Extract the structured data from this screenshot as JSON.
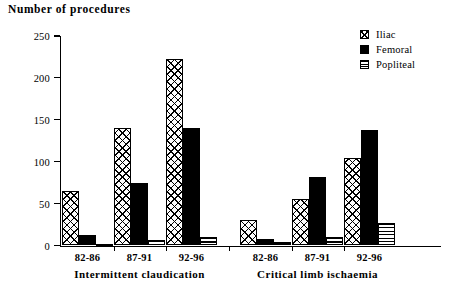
{
  "chart_data": {
    "type": "bar",
    "title": "Number of procedures",
    "xlabel": "",
    "ylabel": "Number of procedures",
    "ylim": [
      0,
      250
    ],
    "yticks": [
      0,
      50,
      100,
      150,
      200,
      250
    ],
    "grid": false,
    "legend_position": "top-right",
    "categories": [
      "82-86",
      "87-91",
      "92-96",
      "82-86",
      "87-91",
      "92-96"
    ],
    "group_labels": [
      "Intermittent claudication",
      "Critical limb ischaemia"
    ],
    "groups": [
      {
        "name": "Intermittent claudication",
        "periods": [
          "82-86",
          "87-91",
          "92-96"
        ]
      },
      {
        "name": "Critical limb ischaemia",
        "periods": [
          "82-86",
          "87-91",
          "92-96"
        ]
      }
    ],
    "series": [
      {
        "name": "Iliac",
        "pattern": "cross-hatch",
        "values": [
          65,
          140,
          222,
          30,
          55,
          105
        ]
      },
      {
        "name": "Femoral",
        "pattern": "solid-black",
        "values": [
          13,
          75,
          140,
          8,
          82,
          138
        ]
      },
      {
        "name": "Popliteal",
        "pattern": "horizontal-stripe",
        "values": [
          2,
          7,
          10,
          4,
          10,
          27
        ]
      }
    ]
  },
  "axis": {
    "y_tick_labels": [
      "0",
      "50",
      "100",
      "150",
      "200",
      "250"
    ]
  },
  "legend": {
    "items": [
      {
        "label": "Iliac"
      },
      {
        "label": "Femoral"
      },
      {
        "label": "Popliteal"
      }
    ]
  }
}
